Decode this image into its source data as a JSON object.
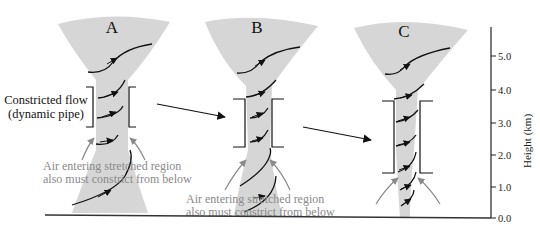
{
  "panels": [
    {
      "label": "A"
    },
    {
      "label": "B"
    },
    {
      "label": "C"
    }
  ],
  "constricted_flow": {
    "line1": "Constricted flow",
    "line2": "(dynamic pipe)"
  },
  "air_note_a": {
    "line1": "Air entering stretched region",
    "line2": "also must constrict from below"
  },
  "air_note_b": {
    "line1": "Air entering stretched region",
    "line2": "also must constrict from below"
  },
  "axis": {
    "label": "Height (km)",
    "ticks": [
      "0.0",
      "1.0",
      "2.0",
      "3.0",
      "4.0",
      "5.0"
    ]
  },
  "colors": {
    "funnel_fill": "#d6d6d6",
    "stream": "#111111",
    "inflow_arrow": "#8a8a8a",
    "note_text": "#8a8a8a"
  }
}
